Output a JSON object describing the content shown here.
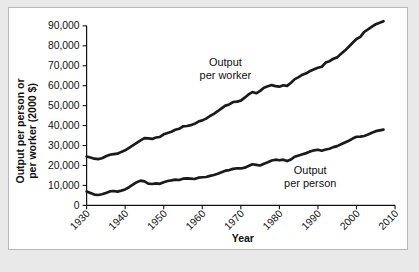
{
  "chart_data": {
    "type": "line",
    "title": "",
    "xlabel": "Year",
    "ylabel": "Output per person or per worker (2000 $)",
    "ylabel_line1": "Output per person or",
    "ylabel_line2": "per worker (2000 $)",
    "xlim": [
      1930,
      2010
    ],
    "ylim": [
      0,
      90000
    ],
    "grid": false,
    "legend_position": "inline-annotation",
    "xticks": [
      1930,
      1940,
      1950,
      1960,
      1970,
      1980,
      1990,
      2000,
      2010
    ],
    "xtick_labels": [
      "1930",
      "1940",
      "1950",
      "1960",
      "1970",
      "1980",
      "1990",
      "2000",
      "2010"
    ],
    "yticks": [
      0,
      10000,
      20000,
      30000,
      40000,
      50000,
      60000,
      70000,
      80000,
      90000
    ],
    "ytick_labels": [
      "0",
      "10,000",
      "20,000",
      "30,000",
      "40,000",
      "50,000",
      "60,000",
      "70,000",
      "80,000",
      "90,000"
    ],
    "annotations": [
      {
        "text_line1": "Output",
        "text_line2": "per worker",
        "x": 1966,
        "y": 70000
      },
      {
        "text_line1": "Output",
        "text_line2": "per person",
        "x": 1988,
        "y": 15500
      }
    ],
    "series": [
      {
        "name": "Output per worker",
        "color": "#1a1a1a",
        "x": [
          1930,
          1931,
          1932,
          1933,
          1934,
          1935,
          1936,
          1937,
          1938,
          1939,
          1940,
          1941,
          1942,
          1943,
          1944,
          1945,
          1946,
          1947,
          1948,
          1949,
          1950,
          1951,
          1952,
          1953,
          1954,
          1955,
          1956,
          1957,
          1958,
          1959,
          1960,
          1961,
          1962,
          1963,
          1964,
          1965,
          1966,
          1967,
          1968,
          1969,
          1970,
          1971,
          1972,
          1973,
          1974,
          1975,
          1976,
          1977,
          1978,
          1979,
          1980,
          1981,
          1982,
          1983,
          1984,
          1985,
          1986,
          1987,
          1988,
          1989,
          1990,
          1991,
          1992,
          1993,
          1994,
          1995,
          1996,
          1997,
          1998,
          1999,
          2000,
          2001,
          2002,
          2003,
          2004,
          2005,
          2006,
          2007
        ],
        "values": [
          24500,
          24000,
          23400,
          23200,
          23600,
          24600,
          25400,
          25700,
          25900,
          26800,
          27600,
          28800,
          30100,
          31300,
          32600,
          33700,
          33600,
          33300,
          34000,
          34300,
          35600,
          36300,
          36900,
          37900,
          38400,
          39600,
          39800,
          40200,
          40900,
          42000,
          42600,
          43500,
          44800,
          45900,
          47200,
          48600,
          50000,
          50600,
          51800,
          52000,
          52500,
          54000,
          55600,
          56800,
          56200,
          57400,
          59000,
          59700,
          60300,
          59800,
          59500,
          60200,
          59900,
          61500,
          63300,
          64300,
          65500,
          66200,
          67400,
          68200,
          69000,
          69500,
          71600,
          72300,
          73500,
          74200,
          76000,
          77600,
          79500,
          81500,
          83400,
          84500,
          87000,
          88200,
          89600,
          90800,
          91500,
          92300
        ],
        "values_scaled_note": "values displayed in 2000 dollars",
        "end_value": 88000
      },
      {
        "name": "Output per person",
        "color": "#1a1a1a",
        "x": [
          1930,
          1931,
          1932,
          1933,
          1934,
          1935,
          1936,
          1937,
          1938,
          1939,
          1940,
          1941,
          1942,
          1943,
          1944,
          1945,
          1946,
          1947,
          1948,
          1949,
          1950,
          1951,
          1952,
          1953,
          1954,
          1955,
          1956,
          1957,
          1958,
          1959,
          1960,
          1961,
          1962,
          1963,
          1964,
          1965,
          1966,
          1967,
          1968,
          1969,
          1970,
          1971,
          1972,
          1973,
          1974,
          1975,
          1976,
          1977,
          1978,
          1979,
          1980,
          1981,
          1982,
          1983,
          1984,
          1985,
          1986,
          1987,
          1988,
          1989,
          1990,
          1991,
          1992,
          1993,
          1994,
          1995,
          1996,
          1997,
          1998,
          1999,
          2000,
          2001,
          2002,
          2003,
          2004,
          2005,
          2006,
          2007
        ],
        "values": [
          7000,
          6200,
          5400,
          5200,
          5600,
          6200,
          7000,
          7200,
          6900,
          7400,
          8000,
          9100,
          10400,
          11600,
          12400,
          12000,
          10900,
          10700,
          11000,
          10800,
          11600,
          12200,
          12500,
          12900,
          12700,
          13400,
          13500,
          13400,
          13200,
          13900,
          14100,
          14200,
          14800,
          15200,
          15800,
          16600,
          17400,
          17700,
          18300,
          18600,
          18500,
          18900,
          19700,
          20600,
          20300,
          20000,
          20900,
          21600,
          22500,
          22900,
          22600,
          22900,
          22200,
          23000,
          24400,
          25000,
          25600,
          26200,
          27000,
          27600,
          27900,
          27400,
          28000,
          28400,
          29200,
          29700,
          30600,
          31500,
          32400,
          33500,
          34400,
          34500,
          34800,
          35500,
          36400,
          37200,
          37600,
          38000
        ],
        "end_value": 38000
      }
    ]
  },
  "figure": {
    "background": "#ffffff",
    "page_background": "#e9e9e9",
    "border_color": "#b9b9b9",
    "line_color": "#1a1a1a",
    "text_color": "#111111"
  }
}
